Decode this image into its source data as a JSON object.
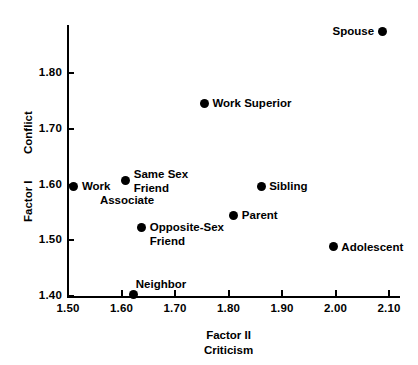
{
  "chart_data": {
    "type": "scatter",
    "title": "",
    "xlabel": "Factor II Criticism",
    "ylabel": "Conflict Factor I",
    "xlabel_lines": [
      "Factor II",
      "Criticism"
    ],
    "ylabel_lines": [
      "Conflict",
      "Factor I"
    ],
    "xlim": [
      1.45,
      2.14
    ],
    "ylim": [
      1.385,
      1.895
    ],
    "grid": false,
    "legend": "none",
    "xticks": [
      "1.50",
      "1.60",
      "1.70",
      "1.80",
      "1.90",
      "2.00",
      "2.10"
    ],
    "xtick_values": [
      1.5,
      1.6,
      1.7,
      1.8,
      1.9,
      2.0,
      2.1
    ],
    "yticks": [
      "1.40",
      "1.50",
      "1.60",
      "1.70",
      "1.80"
    ],
    "ytick_values": [
      1.4,
      1.5,
      1.6,
      1.7,
      1.8
    ],
    "marker_color": "#000000",
    "axis_color": "#000000",
    "background_color": "#ffffff",
    "points": [
      {
        "label": "Spouse",
        "label_lines": [
          "Spouse"
        ],
        "x": 2.087,
        "y": 1.875,
        "label_side": "left"
      },
      {
        "label": "Work Superior",
        "label_lines": [
          "Work Superior"
        ],
        "x": 1.755,
        "y": 1.746,
        "label_side": "right"
      },
      {
        "label": "Same Sex Friend",
        "label_lines": [
          "Same Sex",
          "Friend"
        ],
        "x": 1.608,
        "y": 1.608,
        "label_side": "right"
      },
      {
        "label": "Work Associate",
        "label_lines": [
          "Work",
          "Associate"
        ],
        "x": 1.511,
        "y": 1.597,
        "label_side": "right"
      },
      {
        "label": "Sibling",
        "label_lines": [
          "Sibling"
        ],
        "x": 1.861,
        "y": 1.597,
        "label_side": "right"
      },
      {
        "label": "Parent",
        "label_lines": [
          "Parent"
        ],
        "x": 1.81,
        "y": 1.545,
        "label_side": "right"
      },
      {
        "label": "Opposite-Sex Friend",
        "label_lines": [
          "Opposite-Sex",
          "Friend"
        ],
        "x": 1.638,
        "y": 1.522,
        "label_side": "right"
      },
      {
        "label": "Adolescent",
        "label_lines": [
          "Adolescent"
        ],
        "x": 1.996,
        "y": 1.488,
        "label_side": "right"
      },
      {
        "label": "Neighbor",
        "label_lines": [
          "Neighbor"
        ],
        "x": 1.623,
        "y": 1.402,
        "label_side": "right"
      }
    ]
  }
}
